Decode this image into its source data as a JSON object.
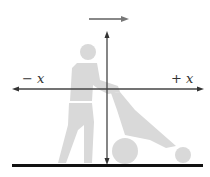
{
  "diagram": {
    "labels": {
      "negative_x": "− x",
      "positive_x": "+ x"
    },
    "colors": {
      "figure": "#d9d9d9",
      "axis": "#333333",
      "ground": "#111111",
      "motion_arrow": "#777777"
    },
    "elements": [
      "person-pushing-lawnmower",
      "x-axis",
      "y-axis",
      "motion-arrow",
      "ground-line"
    ]
  }
}
